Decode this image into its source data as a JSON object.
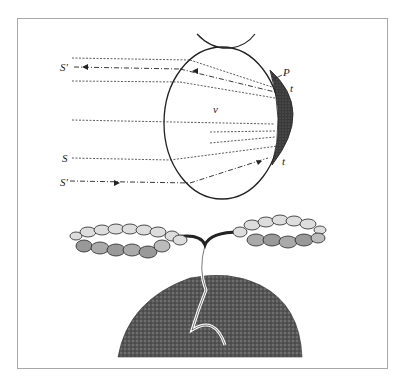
{
  "figure": {
    "eye_diagram": {
      "labels": {
        "s_prime_top": "S'",
        "s": "S",
        "s_prime_bottom": "S'",
        "p": "P",
        "t_top": "t",
        "t_bottom": "t",
        "v": "v"
      },
      "colors": {
        "ink": "#222222",
        "shading": "#3a3a3a",
        "frame": "#a8a8a8"
      }
    },
    "plant_illustration": {
      "description": "branching plant with clustered rounded nodules on soil mound"
    }
  }
}
